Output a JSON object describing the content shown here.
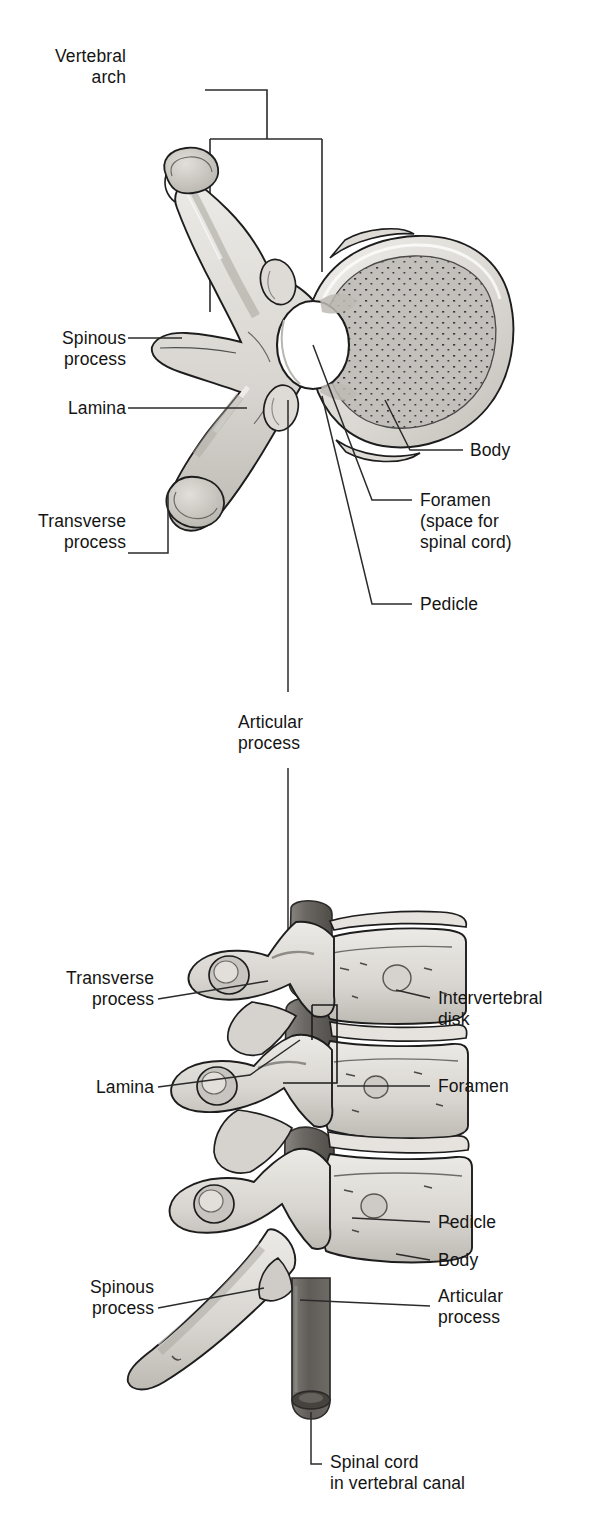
{
  "figure": {
    "type": "anatomical-illustration",
    "style": "grayscale line drawing with stippled shading"
  },
  "colors": {
    "ink": "#141414",
    "leader_line": "#2b2b2b",
    "bone_light": "#e8e6e3",
    "bone_mid": "#cfccc7",
    "bone_shadow": "#b4b0aa",
    "bone_dark": "#9a968f",
    "body_stipple": "#bcbab6",
    "cord_dark": "#6f6c68",
    "cord_darker": "#56534f",
    "background": "#ffffff"
  },
  "panels": {
    "top": {
      "name": "superior-view",
      "caption": "Transverse (superior) view of a single vertebra"
    },
    "bottom": {
      "name": "lateral-view",
      "caption": "Lateral view of three stacked vertebrae with spinal cord"
    }
  },
  "labels": {
    "vertebral_arch": "Vertebral\narch",
    "spinous_process_top": "Spinous\nprocess",
    "lamina_top": "Lamina",
    "transverse_process_top": "Transverse\nprocess",
    "body_top": "Body",
    "foramen_top": "Foramen\n(space for\nspinal cord)",
    "pedicle_top": "Pedicle",
    "articular_process_mid": "Articular\nprocess",
    "transverse_process_bottom": "Transverse\nprocess",
    "lamina_bottom": "Lamina",
    "spinous_process_bottom": "Spinous\nprocess",
    "intervertebral_disk": "Intervertebral\ndisk",
    "foramen_bottom": "Foramen",
    "pedicle_bottom": "Pedicle",
    "body_bottom": "Body",
    "articular_process_bottom": "Articular\nprocess",
    "spinal_cord": "Spinal cord\nin vertebral canal"
  },
  "label_lines": [
    {
      "id": "vertebral-arch",
      "text_anchor": "right",
      "x": 268,
      "y": 82
    },
    {
      "id": "spinous-process-top",
      "text_anchor": "right",
      "x": 120,
      "y": 338
    },
    {
      "id": "lamina-top",
      "text_anchor": "right",
      "x": 120,
      "y": 408
    },
    {
      "id": "transverse-process-top",
      "text_anchor": "right",
      "x": 120,
      "y": 521
    },
    {
      "id": "body-top",
      "text_anchor": "left",
      "x": 470,
      "y": 450
    },
    {
      "id": "foramen-top",
      "text_anchor": "left",
      "x": 420,
      "y": 500
    },
    {
      "id": "pedicle-top",
      "text_anchor": "left",
      "x": 420,
      "y": 604
    },
    {
      "id": "articular-process-mid",
      "text_anchor": "center",
      "x": 288,
      "y": 722
    },
    {
      "id": "transverse-process-bottom",
      "text_anchor": "right",
      "x": 148,
      "y": 978
    },
    {
      "id": "lamina-bottom",
      "text_anchor": "right",
      "x": 148,
      "y": 1087
    },
    {
      "id": "spinous-process-bottom",
      "text_anchor": "right",
      "x": 148,
      "y": 1287
    },
    {
      "id": "intervertebral-disk",
      "text_anchor": "left",
      "x": 438,
      "y": 998
    },
    {
      "id": "foramen-bottom",
      "text_anchor": "left",
      "x": 438,
      "y": 1086
    },
    {
      "id": "pedicle-bottom",
      "text_anchor": "left",
      "x": 438,
      "y": 1222
    },
    {
      "id": "body-bottom",
      "text_anchor": "left",
      "x": 438,
      "y": 1260
    },
    {
      "id": "articular-process-bottom",
      "text_anchor": "left",
      "x": 438,
      "y": 1294
    },
    {
      "id": "spinal-cord",
      "text_anchor": "left",
      "x": 330,
      "y": 1461
    }
  ]
}
